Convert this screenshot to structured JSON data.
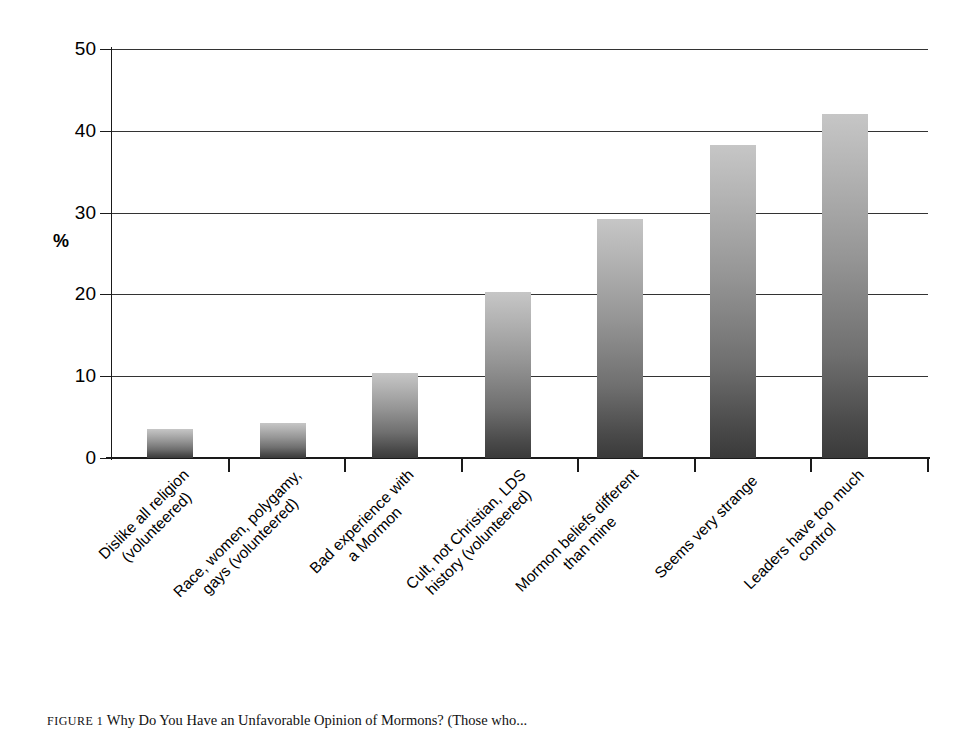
{
  "chart_data": {
    "type": "bar",
    "title": "",
    "xlabel": "",
    "ylabel": "%",
    "ylim": [
      0,
      50
    ],
    "yticks": [
      0,
      10,
      20,
      30,
      40,
      50
    ],
    "grid": true,
    "legend": "none",
    "orientation": "vertical",
    "categories": [
      "Dislike all religion\n(volunteered)",
      "Race, women, polygamy,\ngays (volunteered)",
      "Bad experience with\na Mormon",
      "Cult, not Christian, LDS\nhistory (volunteered)",
      "Mormon beliefs different\nthan mine",
      "Seems very strange",
      "Leaders have too much\ncontrol"
    ],
    "values": [
      3.5,
      4.3,
      10.4,
      20.3,
      29.2,
      38.3,
      42.0
    ],
    "bar_color_top": "#c6c6c6",
    "bar_color_bottom": "#3a3a3a",
    "axis_color": "#1a1a1a",
    "gridline_color": "#333333"
  },
  "axis": {
    "y_title": "%",
    "tick_labels": [
      "50",
      "40",
      "30",
      "20",
      "10",
      "0"
    ]
  },
  "categories_display": [
    {
      "line1": "Dislike all religion",
      "line2": "(volunteered)"
    },
    {
      "line1": "Race, women, polygamy,",
      "line2": "gays (volunteered)"
    },
    {
      "line1": "Bad experience with",
      "line2": "a Mormon"
    },
    {
      "line1": "Cult, not Christian, LDS",
      "line2": "history (volunteered)"
    },
    {
      "line1": "Mormon beliefs different",
      "line2": "than mine"
    },
    {
      "line1": "Seems very strange",
      "line2": ""
    },
    {
      "line1": "Leaders have too much",
      "line2": "control"
    }
  ],
  "caption": {
    "figure_number": "FIGURE 1",
    "text": "Why Do You Have an Unfavorable Opinion of Mormons? (Those who..."
  }
}
